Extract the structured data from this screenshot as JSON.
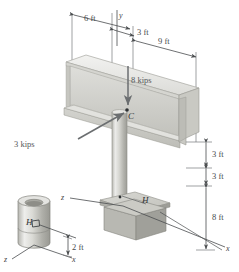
{
  "figure": {
    "background_color": "#ffffff",
    "line_color": "#4a4d4f",
    "steel_light": "#e9e9e7",
    "steel_mid": "#cfcfcb",
    "steel_dark": "#b4b4ae",
    "base_dark": "#a9a9a3"
  },
  "axes": {
    "main": {
      "y_label": "y",
      "x_label": "x",
      "z_label": "z"
    },
    "inset": {
      "x_label": "x",
      "z_label": "z"
    }
  },
  "dimensions": {
    "top": [
      {
        "id": "dim-6ft",
        "label": "6 ft"
      },
      {
        "id": "dim-3ft-top",
        "label": "3 ft"
      },
      {
        "id": "dim-9ft",
        "label": "9 ft"
      }
    ],
    "right": [
      {
        "id": "dim-3ft-upper",
        "label": "3 ft"
      },
      {
        "id": "dim-3ft-lower",
        "label": "3 ft"
      },
      {
        "id": "dim-8ft",
        "label": "8 ft"
      }
    ],
    "inset": [
      {
        "id": "dim-2ft",
        "label": "2 ft"
      }
    ]
  },
  "loads": [
    {
      "id": "load-vertical",
      "label": "8 kips",
      "direction": "downward"
    },
    {
      "id": "load-horizontal",
      "label": "3 kips",
      "direction": "toward-C"
    }
  ],
  "points": [
    {
      "id": "point-c",
      "label": "C",
      "description": "load application point on beam"
    },
    {
      "id": "point-h-main",
      "label": "H",
      "description": "stress point on column near base"
    },
    {
      "id": "point-h-inset",
      "label": "H",
      "description": "stress element on tube detail"
    }
  ]
}
